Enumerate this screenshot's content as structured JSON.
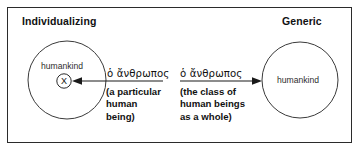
{
  "diagram": {
    "title_left": "Individualizing",
    "title_right": "Generic",
    "left_circle": {
      "label": "humankind",
      "marker": "X"
    },
    "right_circle": {
      "label": "humankind"
    },
    "left_branch": {
      "greek": "ὁ ἄνθρωπος",
      "gloss_line1": "(a particular",
      "gloss_line2": "human",
      "gloss_line3": "being)",
      "arrow_direction": "left"
    },
    "right_branch": {
      "greek": "ὁ ἄνθρωπος",
      "gloss_line1": "(the class of",
      "gloss_line2": "human beings",
      "gloss_line3": "as a whole)",
      "arrow_direction": "right"
    },
    "colors": {
      "border": "#2b2b2b",
      "stroke": "#3a3a3a",
      "text": "#111111",
      "background": "#ffffff"
    }
  }
}
